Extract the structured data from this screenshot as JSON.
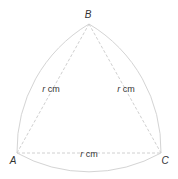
{
  "figure": {
    "shape": "Reuleaux triangle",
    "vertices": {
      "top": "B",
      "left": "A",
      "right": "C"
    },
    "side_labels": {
      "AB": {
        "variable": "r",
        "unit": " cm"
      },
      "BC": {
        "variable": "r",
        "unit": " cm"
      },
      "AC": {
        "variable": "r",
        "unit": " cm"
      }
    },
    "colors": {
      "arc": "#d4d4d4",
      "chord": "#d0d0d0",
      "text": "#333333"
    }
  }
}
